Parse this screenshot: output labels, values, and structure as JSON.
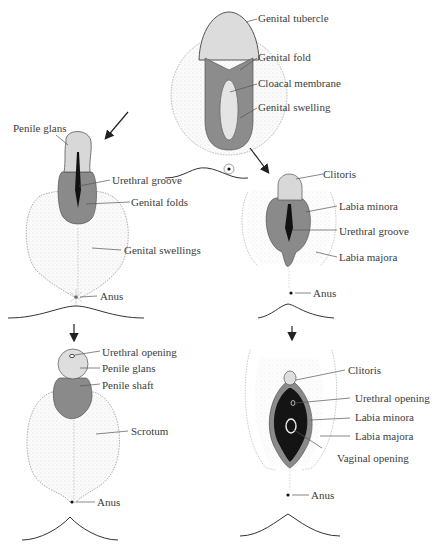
{
  "colors": {
    "fold_tissue": "#8a8a8a",
    "glans_tissue": "#d6d6d6",
    "swelling_stipple": "#b0b0b0",
    "groove_dark": "#111111",
    "vestibule_dark": "#141414",
    "leader_line": "#555555",
    "text": "#3c3c3c"
  },
  "stages": {
    "indifferent": {
      "labels": [
        "Genital tubercle",
        "Genital fold",
        "Cloacal membrane",
        "Genital swelling"
      ]
    },
    "male_intermediate": {
      "labels": [
        "Penile glans",
        "Urethral groove",
        "Genital folds",
        "Genital swellings",
        "Anus"
      ]
    },
    "female_intermediate": {
      "labels": [
        "Clitoris",
        "Labia minora",
        "Urethral groove",
        "Labia majora",
        "Anus"
      ]
    },
    "male_final": {
      "labels": [
        "Urethral opening",
        "Penile glans",
        "Penile shaft",
        "Scrotum",
        "Anus"
      ]
    },
    "female_final": {
      "labels": [
        "Clitoris",
        "Urethral opening",
        "Labia minora",
        "Labia majora",
        "Vaginal opening",
        "Anus"
      ]
    }
  }
}
